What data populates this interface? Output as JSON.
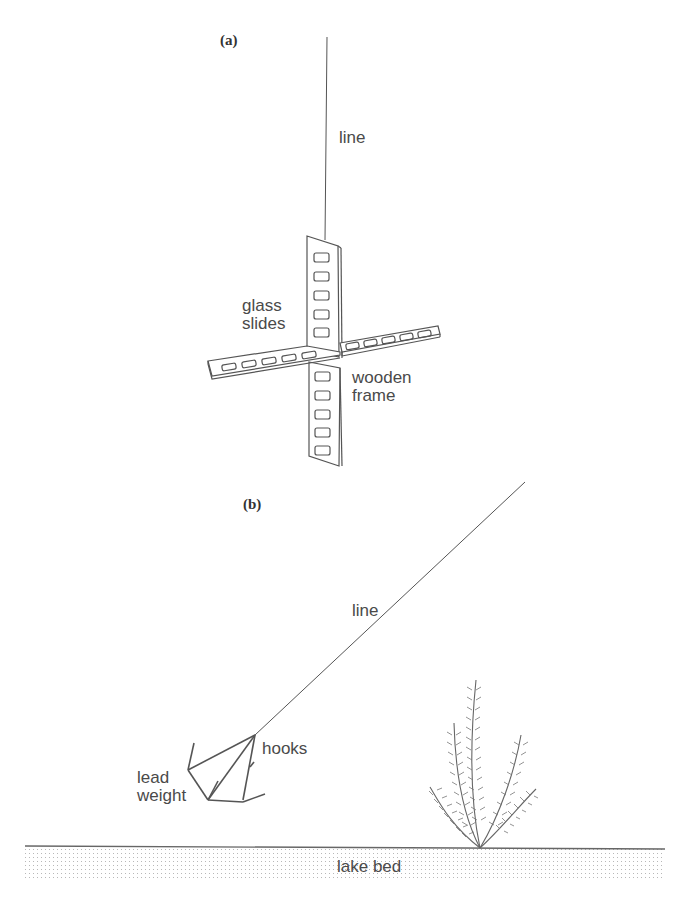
{
  "figure": {
    "panel_a": {
      "label": "(a)",
      "annotations": {
        "line": "line",
        "glass_slides_1": "glass",
        "glass_slides_2": "slides",
        "wooden_frame_1": "wooden",
        "wooden_frame_2": "frame"
      }
    },
    "panel_b": {
      "label": "(b)",
      "annotations": {
        "line": "line",
        "hooks": "hooks",
        "lead_weight_1": "lead",
        "lead_weight_2": "weight",
        "lake_bed": "lake bed"
      }
    },
    "colors": {
      "ink": "#555555",
      "text": "#4a4a4a",
      "stipple": "#bdbdbd",
      "background": "#ffffff"
    }
  }
}
